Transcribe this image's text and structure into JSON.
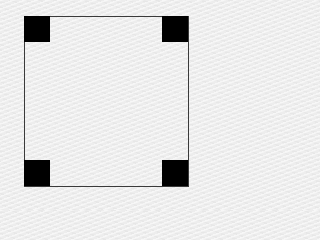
{
  "canvas": {
    "width": 206,
    "height": 210,
    "background_color": "#ededed"
  },
  "frame": {
    "border_color": "#3a3a3a",
    "left": 24,
    "top": 16,
    "right": 188,
    "bottom": 186
  },
  "corner_markers": [
    {
      "position": "top-left",
      "color": "#000000",
      "size": 26
    },
    {
      "position": "top-right",
      "color": "#000000",
      "size": 26
    },
    {
      "position": "bottom-left",
      "color": "#000000",
      "size": 26
    },
    {
      "position": "bottom-right",
      "color": "#000000",
      "size": 26
    }
  ]
}
